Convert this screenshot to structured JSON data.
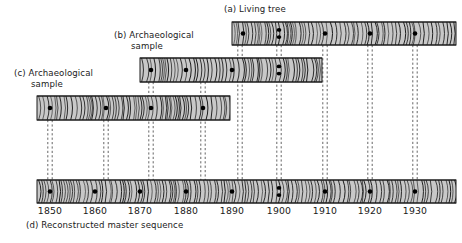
{
  "figure": {
    "title_caption": "(d) Reconstructed master sequence",
    "background": "#ffffff",
    "core_fill": "#c8c8c8",
    "core_stroke": "#1a1a1a",
    "marker_color": "#000000",
    "guide_color": "#555555"
  },
  "labels": {
    "a_line1": "(a) Living tree",
    "b_line1": "(b) Archaeological",
    "b_line2": "sample",
    "c_line1": "(c) Archaeological",
    "c_line2": "sample",
    "d_caption": "(d) Reconstructed master sequence"
  },
  "axis": {
    "ticks": [
      "1850",
      "1860",
      "1870",
      "1880",
      "1890",
      "1900",
      "1910",
      "1920",
      "1930"
    ],
    "tick_years": [
      1850,
      1860,
      1870,
      1880,
      1890,
      1900,
      1910,
      1920,
      1930
    ],
    "tick_x": [
      50,
      95,
      140,
      186,
      232,
      279,
      325,
      370,
      415
    ],
    "pixels_per_decade": 45.6,
    "year_min": 1843,
    "year_max": 1939
  },
  "chart_data": {
    "type": "timeline",
    "xlabel": "Year (AD)",
    "ylabel": "",
    "xlim": [
      1843,
      1939
    ],
    "grid": false,
    "legend": "none",
    "samples": [
      {
        "id": "a",
        "label": "(a) Living tree",
        "start_year": 1887,
        "end_year": 1939,
        "x0": 232,
        "x1": 456,
        "y0": 22,
        "y1": 45,
        "marker_years": [
          1890,
          1900,
          1900,
          1910,
          1920,
          1930
        ],
        "marker_x": [
          243,
          279,
          279,
          325,
          370,
          415
        ],
        "double_marker_years": [
          1900
        ]
      },
      {
        "id": "b",
        "label": "(b) Archaeological sample",
        "start_year": 1866,
        "end_year": 1909,
        "x0": 140,
        "x1": 322,
        "y0": 58,
        "y1": 82,
        "marker_years": [
          1870,
          1880,
          1890,
          1900,
          1900
        ],
        "marker_x": [
          151,
          186,
          232,
          279,
          279
        ],
        "double_marker_years": [
          1900
        ]
      },
      {
        "id": "c",
        "label": "(c) Archaeological sample",
        "start_year": 1845,
        "end_year": 1887,
        "x0": 37,
        "x1": 230,
        "y0": 96,
        "y1": 120,
        "marker_years": [
          1850,
          1860,
          1870,
          1880
        ],
        "marker_x": [
          50,
          106,
          151,
          203
        ],
        "double_marker_years": []
      },
      {
        "id": "d",
        "label": "(d) Reconstructed master sequence",
        "start_year": 1845,
        "end_year": 1939,
        "x0": 37,
        "x1": 456,
        "y0": 180,
        "y1": 203,
        "marker_years": [
          1850,
          1860,
          1870,
          1880,
          1890,
          1900,
          1900,
          1910,
          1920,
          1930
        ],
        "marker_x": [
          50,
          95,
          140,
          186,
          232,
          279,
          279,
          325,
          370,
          415
        ],
        "double_marker_years": [
          1900
        ]
      }
    ],
    "correlation_guides": [
      {
        "year": 1850,
        "x": 50,
        "from_y": 120,
        "to_y": 180
      },
      {
        "year": 1860,
        "x": 106,
        "from_y": 120,
        "to_y": 180
      },
      {
        "year": 1870,
        "x": 151,
        "from_y": 82,
        "to_y": 180
      },
      {
        "year": 1880,
        "x": 203,
        "from_y": 82,
        "to_y": 180
      },
      {
        "year": 1890,
        "x": 240,
        "from_y": 45,
        "to_y": 180
      },
      {
        "year": 1900,
        "x": 279,
        "from_y": 45,
        "to_y": 180
      },
      {
        "year": 1910,
        "x": 325,
        "from_y": 45,
        "to_y": 180
      },
      {
        "year": 1920,
        "x": 370,
        "from_y": 45,
        "to_y": 180
      },
      {
        "year": 1930,
        "x": 415,
        "from_y": 45,
        "to_y": 180
      }
    ]
  }
}
